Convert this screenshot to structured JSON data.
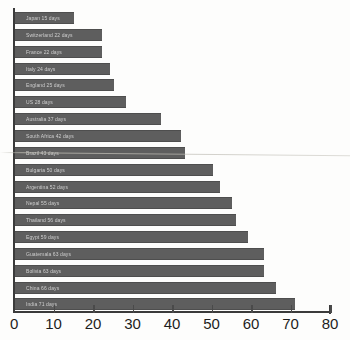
{
  "chart_data": {
    "type": "bar",
    "orientation": "horizontal",
    "title": "",
    "subtitle": "",
    "xlabel": "",
    "ylabel": "",
    "xlim": [
      0,
      80
    ],
    "grid": false,
    "legend": null,
    "bar_color": "#5e5e5e",
    "axis_color": "#3b3b3b",
    "xticks": [
      0,
      10,
      20,
      30,
      40,
      50,
      60,
      70,
      80
    ],
    "xtick_labels": [
      "0",
      "10",
      "20",
      "30",
      "40",
      "50",
      "60",
      "70",
      "80"
    ],
    "categories": [
      "Japan 15 days",
      "Switzerland 22 days",
      "France 22 days",
      "Italy 24 days",
      "England 25 days",
      "US 28 days",
      "Australia 37 days",
      "South Africa 42 days",
      "Brazil 43 days",
      "Bulgaria 50 days",
      "Argentina 52 days",
      "Nepal 55 days",
      "Thailand 56 days",
      "Egypt 59 days",
      "Guatemala 63 days",
      "Bolivia 63 days",
      "China 66 days",
      "India 71 days"
    ],
    "values": [
      15,
      22,
      22,
      24,
      25,
      28,
      37,
      42,
      43,
      50,
      52,
      55,
      56,
      59,
      63,
      63,
      66,
      71
    ]
  }
}
